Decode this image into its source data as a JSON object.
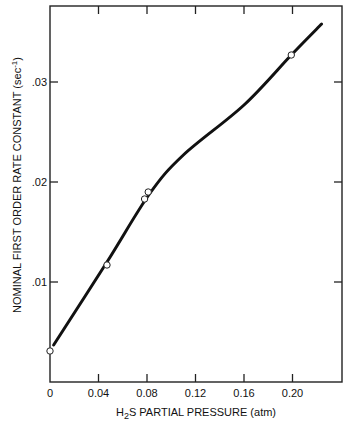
{
  "chart_data": {
    "type": "line",
    "title": "",
    "xlabel": "H2S PARTIAL PRESSURE (atm)",
    "xlabel_parts": {
      "pre": "H",
      "sub": "2",
      "post": "S PARTIAL PRESSURE (atm)"
    },
    "ylabel": "NOMINAL FIRST ORDER RATE CONSTANT (sec-1)",
    "ylabel_parts": {
      "main": "NOMINAL FIRST ORDER RATE CONSTANT (sec",
      "sup": "-1",
      "close": ")"
    },
    "xlim": [
      0,
      0.24
    ],
    "ylim": [
      0,
      0.0376
    ],
    "x_ticks": [
      0,
      0.04,
      0.08,
      0.12,
      0.16,
      0.2
    ],
    "x_tick_labels": [
      "0",
      "0.04",
      "0.08",
      "0.12",
      "0.16",
      "0.20"
    ],
    "y_ticks": [
      0.01,
      0.02,
      0.03
    ],
    "y_tick_labels": [
      ".01",
      ".02",
      ".03"
    ],
    "grid": false,
    "legend": null,
    "series": [
      {
        "name": "measured",
        "style": "open-circle markers",
        "x": [
          0.0,
          0.047,
          0.078,
          0.081,
          0.199
        ],
        "y": [
          0.0031,
          0.0117,
          0.0183,
          0.019,
          0.0327
        ]
      },
      {
        "name": "fitted curve",
        "style": "solid thick line",
        "x": [
          0.003,
          0.047,
          0.082,
          0.11,
          0.16,
          0.199,
          0.224
        ],
        "y": [
          0.0037,
          0.012,
          0.0188,
          0.0227,
          0.0277,
          0.0327,
          0.0358
        ]
      }
    ]
  }
}
